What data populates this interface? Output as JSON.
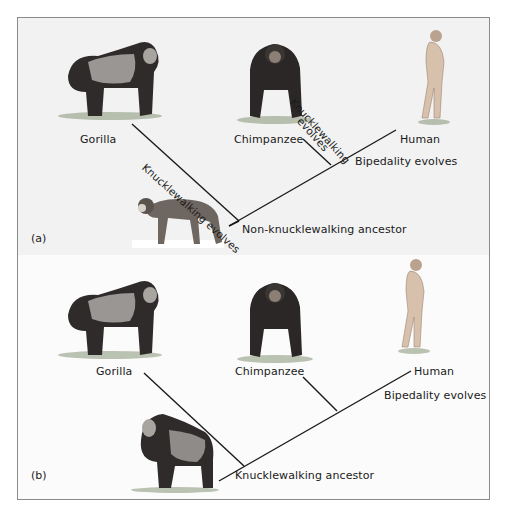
{
  "figure": {
    "panel_a": {
      "tag": "(a)",
      "taxa": {
        "gorilla": "Gorilla",
        "chimpanzee": "Chimpanzee",
        "human": "Human"
      },
      "branch_annotations": {
        "gorilla_branch": "Knucklewalking evolves",
        "chimp_branch_line1": "Knucklewalking",
        "chimp_branch_line2": "evolves",
        "human_branch": "Bipedality evolves"
      },
      "ancestor": "Non-knucklewalking ancestor"
    },
    "panel_b": {
      "tag": "(b)",
      "taxa": {
        "gorilla": "Gorilla",
        "chimpanzee": "Chimpanzee",
        "human": "Human"
      },
      "branch_annotations": {
        "human_branch": "Bipedality evolves"
      },
      "ancestor": "Knucklewalking ancestor"
    },
    "colors": {
      "line": "#1a1a1a",
      "border": "#8a8a8a",
      "panel_a_bg": "#f2f2f2",
      "panel_b_bg": "#fbfbfb",
      "ape_dark": "#2e2b2a",
      "ape_silver": "#9a9694",
      "human_skin": "#d7c1ad",
      "monkey": "#6e6660"
    }
  }
}
